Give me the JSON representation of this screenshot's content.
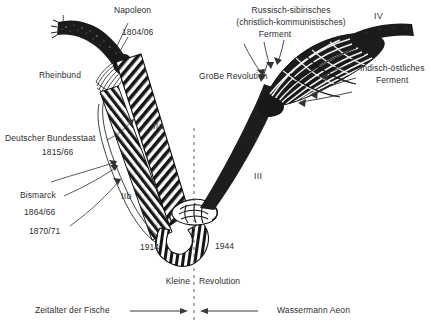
{
  "figure": {
    "title_hidden": "",
    "labels": {
      "marker_I": "I",
      "marker_IIa": "IIa",
      "marker_IIb": "IIb",
      "marker_III": "III",
      "marker_IV": "IV",
      "napoleon": "Napoleon",
      "napoleon_years": "1804/06",
      "rheinbund": "Rheinbund",
      "bundesstaat": "Deutscher Bundesstaat",
      "bundesstaat_years": "1815/66",
      "bismarck": "Bismarck",
      "bismarck_years_1": "1864/66",
      "bismarck_years_2": "1870/71",
      "grosse_revolution": "GroBe Revolution",
      "russisch_line1": "Russisch-sibirisches",
      "russisch_line2": "(christlich-kommunistisches)",
      "russisch_line3": "Ferment",
      "indisch_line1": "Indisch-östliches",
      "indisch_line2": "Ferment",
      "year_1914": "1914",
      "year_1944": "1944",
      "kleine": "Kleine",
      "revolution": "Revolution",
      "aeon_left": "Zeitalter der Fische",
      "aeon_right": "Wassermann Aeon"
    },
    "colors": {
      "ink": "#1a1a1a",
      "text": "#2e2e2e",
      "paper": "#ffffff",
      "divider": "#555555"
    }
  }
}
